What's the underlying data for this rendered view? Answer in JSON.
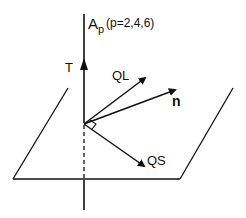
{
  "diagram": {
    "labels": {
      "axis_main": "A",
      "axis_sub": "p",
      "axis_params": "(p=2,4,6)",
      "T": "T",
      "QL": "QL",
      "n": "n",
      "QS": "QS"
    },
    "colors": {
      "line": "#111111",
      "background": "#ffffff"
    }
  }
}
